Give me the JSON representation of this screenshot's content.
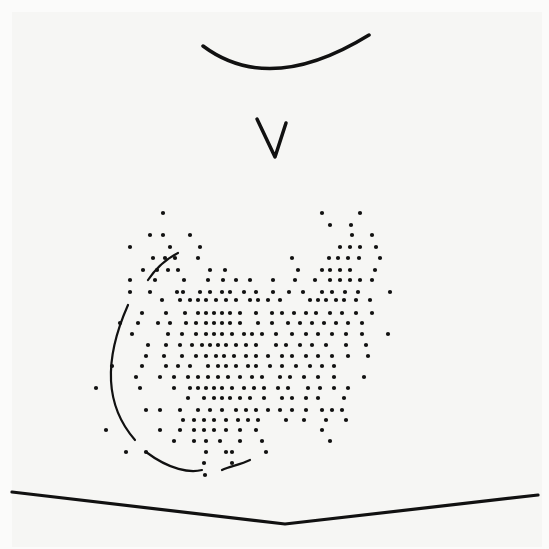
{
  "figure": {
    "ink_color": "#111111",
    "paper_color": "#f6f6f4",
    "strokes": {
      "top_arc": "M203,46 Q270,96 369,35",
      "v_mark": "M257,119 L275,157 L286,123",
      "left_curve_upper": "M148,280 C158,265 168,258 178,253",
      "left_curve_main": "M128,305 C108,350 100,400 135,440",
      "bottom_curve_left": "M146,452 C170,470 190,473 202,470",
      "bottom_curve_right": "M222,470 C230,466 240,465 250,460",
      "baseline": "M12,492 L285,524 L538,495"
    },
    "dot_rows": [
      {
        "y": 213,
        "xs": [
          163,
          322,
          360
        ]
      },
      {
        "y": 225,
        "xs": [
          330,
          351
        ]
      },
      {
        "y": 235,
        "xs": [
          150,
          163,
          190,
          352,
          372
        ]
      },
      {
        "y": 247,
        "xs": [
          130,
          170,
          200,
          340,
          350,
          360,
          376
        ]
      },
      {
        "y": 258,
        "xs": [
          153,
          165,
          175,
          198,
          292,
          329,
          338,
          348,
          359,
          380
        ]
      },
      {
        "y": 270,
        "xs": [
          143,
          157,
          168,
          178,
          210,
          225,
          298,
          322,
          330,
          340,
          350,
          375
        ]
      },
      {
        "y": 280,
        "xs": [
          130,
          155,
          184,
          208,
          223,
          236,
          250,
          273,
          295,
          315,
          330,
          340,
          350,
          360,
          372
        ]
      },
      {
        "y": 292,
        "xs": [
          130,
          150,
          177,
          183,
          200,
          210,
          222,
          230,
          244,
          256,
          273,
          289,
          303,
          322,
          332,
          345,
          358,
          390
        ]
      },
      {
        "y": 300,
        "xs": [
          162,
          180,
          190,
          198,
          206,
          216,
          226,
          236,
          250,
          258,
          268,
          280,
          310,
          318,
          326,
          336,
          344,
          356,
          370
        ]
      },
      {
        "y": 313,
        "xs": [
          142,
          166,
          185,
          198,
          206,
          214,
          222,
          230,
          240,
          256,
          272,
          282,
          294,
          306,
          316,
          330,
          342,
          356,
          372
        ]
      },
      {
        "y": 323,
        "xs": [
          120,
          138,
          158,
          170,
          186,
          196,
          206,
          214,
          222,
          230,
          240,
          258,
          272,
          288,
          300,
          312,
          324,
          336,
          348,
          362
        ]
      },
      {
        "y": 334,
        "xs": [
          132,
          168,
          182,
          196,
          206,
          214,
          222,
          232,
          244,
          252,
          262,
          276,
          292,
          306,
          318,
          332,
          346,
          362,
          388
        ]
      },
      {
        "y": 345,
        "xs": [
          148,
          166,
          180,
          192,
          202,
          210,
          218,
          226,
          236,
          246,
          256,
          276,
          286,
          300,
          312,
          326,
          346,
          366
        ]
      },
      {
        "y": 356,
        "xs": [
          146,
          164,
          182,
          196,
          206,
          216,
          224,
          234,
          246,
          256,
          268,
          282,
          292,
          306,
          318,
          332,
          348,
          368
        ]
      },
      {
        "y": 366,
        "xs": [
          112,
          142,
          166,
          178,
          190,
          208,
          218,
          226,
          236,
          248,
          256,
          270,
          282,
          296,
          310,
          322,
          334
        ]
      },
      {
        "y": 377,
        "xs": [
          136,
          160,
          174,
          188,
          198,
          208,
          218,
          228,
          240,
          252,
          262,
          280,
          290,
          304,
          318,
          334,
          364
        ]
      },
      {
        "y": 388,
        "xs": [
          96,
          140,
          174,
          190,
          198,
          206,
          214,
          222,
          232,
          244,
          254,
          264,
          278,
          288,
          308,
          320,
          334,
          348
        ]
      },
      {
        "y": 398,
        "xs": [
          188,
          204,
          214,
          222,
          230,
          240,
          250,
          264,
          282,
          292,
          306,
          318,
          344
        ]
      },
      {
        "y": 410,
        "xs": [
          146,
          160,
          180,
          198,
          210,
          222,
          236,
          246,
          256,
          268,
          280,
          292,
          306,
          322,
          332,
          342
        ]
      },
      {
        "y": 420,
        "xs": [
          183,
          194,
          204,
          214,
          226,
          238,
          248,
          258,
          286,
          304,
          326,
          346
        ]
      },
      {
        "y": 430,
        "xs": [
          106,
          160,
          180,
          194,
          204,
          214,
          226,
          240,
          256,
          322
        ]
      },
      {
        "y": 441,
        "xs": [
          174,
          194,
          206,
          220,
          240,
          262,
          330
        ]
      },
      {
        "y": 452,
        "xs": [
          126,
          146,
          206,
          226,
          232,
          266
        ]
      },
      {
        "y": 463,
        "xs": [
          204,
          232
        ]
      },
      {
        "y": 475,
        "xs": [
          205
        ]
      }
    ]
  }
}
